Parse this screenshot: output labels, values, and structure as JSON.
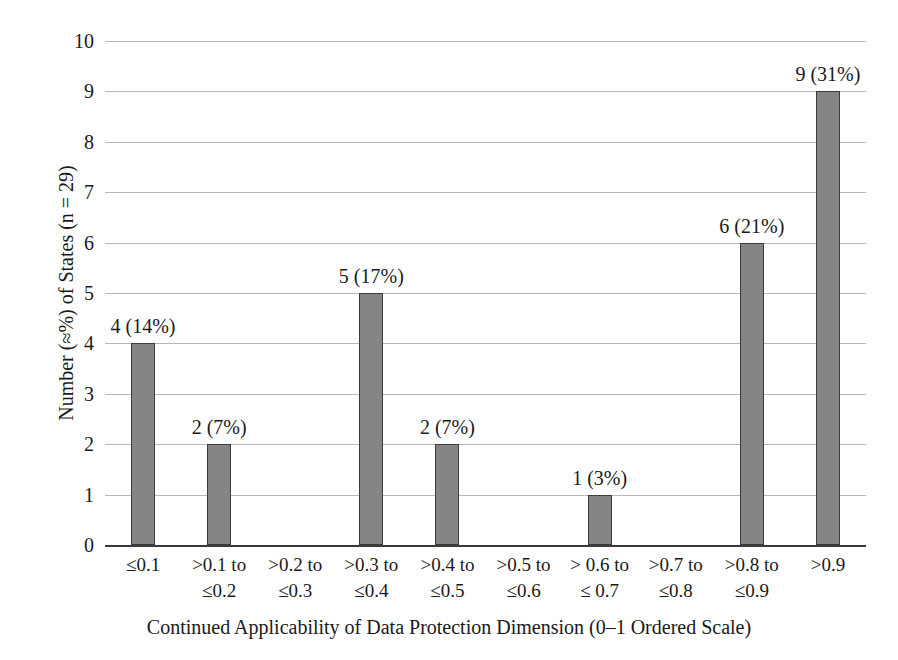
{
  "chart_data": {
    "type": "bar",
    "title": "",
    "xlabel": "Continued Applicability of Data Protection Dimension (0–1 Ordered Scale)",
    "ylabel": "Number (≈%) of States (n = 29)",
    "categories": [
      "≤0.1",
      ">0.1 to ≤0.2",
      ">0.2 to ≤0.3",
      ">0.3 to ≤0.4",
      ">0.4 to ≤0.5",
      ">0.5 to ≤0.6",
      "> 0.6 to ≤ 0.7",
      ">0.7 to ≤0.8",
      ">0.8 to ≤0.9",
      ">0.9"
    ],
    "category_lines": [
      [
        "≤0.1",
        ""
      ],
      [
        ">0.1 to",
        "≤0.2"
      ],
      [
        ">0.2 to",
        "≤0.3"
      ],
      [
        ">0.3 to",
        "≤0.4"
      ],
      [
        ">0.4 to",
        "≤0.5"
      ],
      [
        ">0.5 to",
        "≤0.6"
      ],
      [
        "> 0.6 to",
        "≤ 0.7"
      ],
      [
        ">0.7 to",
        "≤0.8"
      ],
      [
        ">0.8 to",
        "≤0.9"
      ],
      [
        ">0.9",
        ""
      ]
    ],
    "values": [
      4,
      2,
      0,
      5,
      2,
      0,
      1,
      0,
      6,
      9
    ],
    "percent_labels": [
      "14%",
      "7%",
      "",
      "17%",
      "7%",
      "",
      "3%",
      "",
      "21%",
      "31%"
    ],
    "point_labels": [
      "4 (14%)",
      "2 (7%)",
      "",
      "5 (17%)",
      "2 (7%)",
      "",
      "1 (3%)",
      "",
      "6 (21%)",
      "9 (31%)"
    ],
    "ylim": [
      0,
      10
    ],
    "ytick_values": [
      0,
      1,
      2,
      3,
      4,
      5,
      6,
      7,
      8,
      9,
      10
    ],
    "ytick_labels": [
      "0",
      "1",
      "2",
      "3",
      "4",
      "5",
      "6",
      "7",
      "8",
      "9",
      "10"
    ],
    "grid": true,
    "legend": "none",
    "n_total": 29,
    "bar_color": "#858585",
    "bar_border_color": "#3b3b3b",
    "grid_color": "#b9b9b9",
    "axis_color": "#3a3a3a",
    "background": "#ffffff"
  }
}
